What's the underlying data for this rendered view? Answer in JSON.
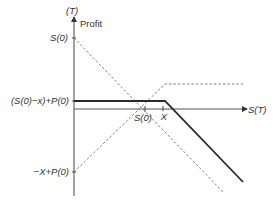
{
  "diagram": {
    "type": "payoff-diagram",
    "y_axis": {
      "label_top": "(T)",
      "label": "Profit",
      "ticks": [
        {
          "label": "S(0)",
          "y": 38
        },
        {
          "label": "(S(0)−x)+P(0)",
          "y": 101
        },
        {
          "label": "−X+P(0)",
          "y": 172
        }
      ]
    },
    "x_axis": {
      "label": "S(T)",
      "ticks": [
        {
          "label": "S(0)",
          "x": 145
        },
        {
          "label": "X",
          "x": 163
        }
      ]
    },
    "series": [
      {
        "name": "protective-put-profit",
        "style": "solid-thick",
        "color": "#2a2a2a",
        "points": [
          [
            74,
            101
          ],
          [
            165,
            101
          ],
          [
            243,
            182
          ]
        ]
      },
      {
        "name": "long-stock-profit",
        "style": "dashed",
        "color": "#777777",
        "points": [
          [
            74,
            38
          ],
          [
            223,
            192
          ]
        ]
      },
      {
        "name": "long-put-profit",
        "style": "dashed",
        "color": "#777777",
        "points": [
          [
            74,
            172
          ],
          [
            165,
            84
          ],
          [
            243,
            84
          ]
        ]
      }
    ]
  },
  "labels": {
    "y_top": "(T)",
    "profit": "Profit",
    "y_s0": "S(0)",
    "y_mid": "(S(0)−x)+P(0)",
    "y_low": "−X+P(0)",
    "x_s0": "S(0)",
    "x_x": "X",
    "x_axis": "S(T)"
  }
}
